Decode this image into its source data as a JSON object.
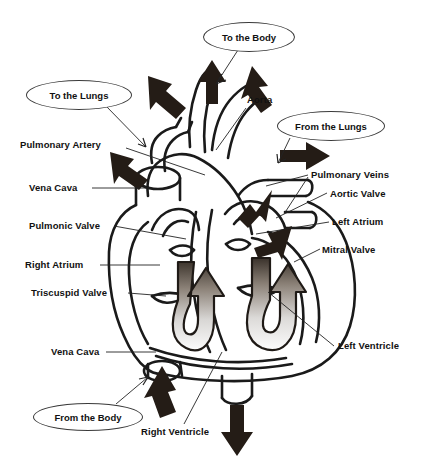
{
  "diagram": {
    "type": "labeled-anatomical-diagram",
    "colors": {
      "outline": "#1a1a1a",
      "background": "#ffffff",
      "arrow_solid": "#241c16",
      "flow_gradient_dark": "#4a4038",
      "flow_gradient_light": "#f2f2f2",
      "leader_line": "#222222",
      "callout_border": "#3a3a3a"
    },
    "callouts": [
      {
        "id": "to-the-body",
        "text": "To the Body",
        "x": 203,
        "y": 22,
        "w": 90,
        "h": 28
      },
      {
        "id": "to-the-lungs",
        "text": "To the Lungs",
        "x": 26,
        "y": 80,
        "w": 104,
        "h": 28
      },
      {
        "id": "from-the-lungs",
        "text": "From the Lungs",
        "x": 277,
        "y": 111,
        "w": 106,
        "h": 28
      },
      {
        "id": "from-the-body",
        "text": "From the Body",
        "x": 33,
        "y": 403,
        "w": 108,
        "h": 26
      }
    ],
    "labels": [
      {
        "id": "aorta",
        "text": "Aorta",
        "x": 247,
        "y": 95,
        "align": "left"
      },
      {
        "id": "pulmonary-artery",
        "text": "Pulmonary Artery",
        "x": 20,
        "y": 140,
        "align": "left"
      },
      {
        "id": "vena-cava-upper",
        "text": "Vena Cava",
        "x": 29,
        "y": 183,
        "align": "left"
      },
      {
        "id": "pulmonic-valve",
        "text": "Pulmonic Valve",
        "x": 29,
        "y": 221,
        "align": "left"
      },
      {
        "id": "right-atrium",
        "text": "Right Atrium",
        "x": 25,
        "y": 260,
        "align": "left"
      },
      {
        "id": "triscuspid-valve",
        "text": "Triscuspid Valve",
        "x": 31,
        "y": 288,
        "align": "left"
      },
      {
        "id": "vena-cava-lower",
        "text": "Vena Cava",
        "x": 51,
        "y": 347,
        "align": "left"
      },
      {
        "id": "pulmonary-veins",
        "text": "Pulmonary Veins",
        "x": 311,
        "y": 170,
        "align": "left"
      },
      {
        "id": "aortic-valve",
        "text": "Aortic Valve",
        "x": 330,
        "y": 189,
        "align": "left"
      },
      {
        "id": "left-atrium",
        "text": "Left Atrium",
        "x": 332,
        "y": 217,
        "align": "left"
      },
      {
        "id": "mitral-valve",
        "text": "Mitral Valve",
        "x": 322,
        "y": 245,
        "align": "left"
      },
      {
        "id": "left-ventricle",
        "text": "Left Ventricle",
        "x": 338,
        "y": 341,
        "align": "left"
      },
      {
        "id": "right-ventricle",
        "text": "Right Ventricle",
        "x": 141,
        "y": 427,
        "align": "left"
      }
    ],
    "flow_arrows": [
      {
        "id": "to-body-arrow",
        "direction": "up",
        "style": "solid-black"
      },
      {
        "id": "to-lungs-arrow-left",
        "direction": "up-left",
        "style": "solid-black"
      },
      {
        "id": "to-lungs-arrow-right",
        "direction": "up-right",
        "style": "solid-black"
      },
      {
        "id": "pulmonary-artery-arrow",
        "direction": "up-left",
        "style": "solid-black"
      },
      {
        "id": "from-lungs-arrow",
        "direction": "right",
        "style": "solid-black"
      },
      {
        "id": "into-left-atrium-arrow",
        "direction": "down-left",
        "style": "solid-black"
      },
      {
        "id": "mitral-inflow-arrow",
        "direction": "down-left",
        "style": "solid-black"
      },
      {
        "id": "from-body-arrow",
        "direction": "up",
        "style": "solid-black"
      },
      {
        "id": "out-bottom-arrow",
        "direction": "down",
        "style": "solid-black"
      },
      {
        "id": "right-ventricle-flow",
        "direction": "u-turn-up",
        "style": "gradient-gray"
      },
      {
        "id": "left-ventricle-flow",
        "direction": "u-turn-up",
        "style": "gradient-gray"
      }
    ]
  }
}
